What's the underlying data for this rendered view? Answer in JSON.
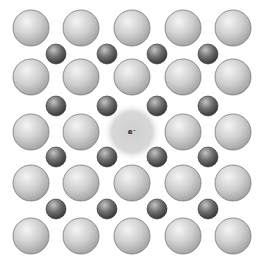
{
  "diagram": {
    "title": "",
    "colors": {
      "background": "#ffffff",
      "large_ion_light": "#eeeeee",
      "large_ion_dark": "#a9a9a9",
      "large_ion_outline": "#7a7a7a",
      "small_ion_light": "#b5b5b5",
      "small_ion_dark": "#3c3c3c",
      "small_ion_outline": "#2e2e2e",
      "electron_cloud": "#d3d3d3"
    },
    "large_ions": {
      "radius": 18,
      "cols_x": [
        31,
        81,
        132,
        183,
        233
      ],
      "rows_y": [
        28,
        77,
        132,
        183,
        236
      ]
    },
    "small_ions": {
      "radius": 10,
      "cols_x": [
        56,
        107,
        157,
        208
      ],
      "rows_y": [
        54,
        106,
        157,
        209
      ]
    },
    "vacancy": {
      "row": 2,
      "col": 2,
      "cx": 132,
      "cy": 132,
      "cloud_radius": 29,
      "label": "e⁻"
    }
  }
}
